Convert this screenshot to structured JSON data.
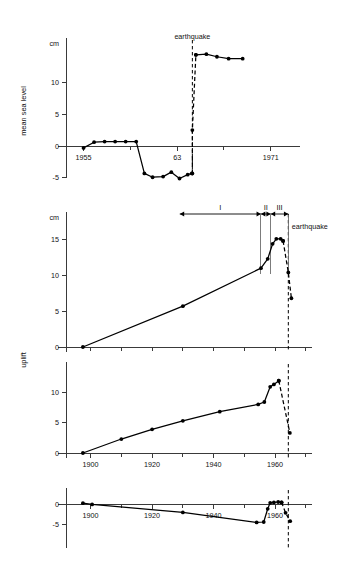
{
  "figure": {
    "title": "",
    "event_label": "earthquake",
    "unit_label": "cm"
  },
  "chart_data": [
    {
      "id": "panel-sea-level",
      "type": "line",
      "title": "",
      "xlabel": "",
      "ylabel": "mean sea level",
      "yunit": "cm",
      "xlim": [
        1953.5,
        1973.5
      ],
      "ylim": [
        -7,
        16
      ],
      "ytick_values": [
        -5,
        0,
        5,
        10
      ],
      "ytick_labels": [
        "-5",
        "0",
        "5",
        "10"
      ],
      "xtick_values": [
        1955,
        1959,
        1963,
        1967,
        1971
      ],
      "xtick_labeled": [
        1955,
        1963,
        1971
      ],
      "xtick_labels": [
        "1955",
        "63",
        "1971"
      ],
      "grid": false,
      "legend": "none",
      "annotations": [
        {
          "text": "earthquake",
          "x": 1964.3,
          "y": 16.8
        }
      ],
      "event_year": 1964.3,
      "series": [
        {
          "name": "pre-earthquake mean sea level",
          "style": "solid",
          "markers": true,
          "points": [
            {
              "x": 1955.0,
              "y": -0.3
            },
            {
              "x": 1955.9,
              "y": 0.6
            },
            {
              "x": 1956.8,
              "y": 0.7
            },
            {
              "x": 1957.7,
              "y": 0.7
            },
            {
              "x": 1958.6,
              "y": 0.7
            },
            {
              "x": 1959.5,
              "y": 0.7
            },
            {
              "x": 1960.2,
              "y": -4.3
            },
            {
              "x": 1960.9,
              "y": -4.9
            },
            {
              "x": 1961.8,
              "y": -4.8
            },
            {
              "x": 1962.5,
              "y": -4.1
            },
            {
              "x": 1963.2,
              "y": -5.1
            },
            {
              "x": 1963.9,
              "y": -4.5
            },
            {
              "x": 1964.25,
              "y": -4.3
            }
          ]
        },
        {
          "name": "co-seismic jump",
          "style": "dashed",
          "markers": true,
          "points": [
            {
              "x": 1964.3,
              "y": -4.3
            },
            {
              "x": 1964.3,
              "y": 2.5
            },
            {
              "x": 1964.6,
              "y": 14.3
            }
          ]
        },
        {
          "name": "post-earthquake mean sea level",
          "style": "solid",
          "markers": true,
          "points": [
            {
              "x": 1964.6,
              "y": 14.3
            },
            {
              "x": 1965.5,
              "y": 14.4
            },
            {
              "x": 1966.4,
              "y": 14.0
            },
            {
              "x": 1967.4,
              "y": 13.7
            },
            {
              "x": 1968.6,
              "y": 13.7
            }
          ]
        }
      ]
    },
    {
      "id": "panel-uplift-large",
      "type": "line",
      "title": "",
      "xlabel": "",
      "ylabel": "uplift",
      "yunit": "cm",
      "xlim": [
        1892,
        1972
      ],
      "ylim": [
        -1.5,
        18
      ],
      "ytick_values": [
        0,
        5,
        10,
        15
      ],
      "ytick_labels": [
        "0",
        "5",
        "10",
        "15"
      ],
      "xtick_values": [
        1900,
        1910,
        1920,
        1930,
        1940,
        1950,
        1960,
        1970
      ],
      "xtick_labeled": [],
      "xtick_labels": [],
      "grid": false,
      "legend": "none",
      "event_year": 1964.3,
      "annotations": [
        {
          "text": "earthquake",
          "x": 1964.8,
          "y": 16.4
        }
      ],
      "phases": [
        {
          "label": "I",
          "x_start": 1929.0,
          "x_end": 1955.4
        },
        {
          "label": "II",
          "x_start": 1955.4,
          "x_end": 1958.6
        },
        {
          "label": "III",
          "x_start": 1958.6,
          "x_end": 1964.3
        }
      ],
      "series": [
        {
          "name": "interseismic uplift",
          "style": "solid",
          "markers": true,
          "points": [
            {
              "x": 1897.5,
              "y": 0.0
            },
            {
              "x": 1930.0,
              "y": 5.7
            },
            {
              "x": 1955.4,
              "y": 11.0
            },
            {
              "x": 1957.6,
              "y": 12.3
            },
            {
              "x": 1959.2,
              "y": 14.4
            },
            {
              "x": 1960.4,
              "y": 15.1
            },
            {
              "x": 1961.8,
              "y": 15.1
            },
            {
              "x": 1962.6,
              "y": 14.8
            }
          ]
        },
        {
          "name": "co-seismic subsidence",
          "style": "dashed",
          "markers": true,
          "points": [
            {
              "x": 1962.6,
              "y": 14.8
            },
            {
              "x": 1964.3,
              "y": 10.4
            },
            {
              "x": 1965.3,
              "y": 6.8
            }
          ]
        }
      ]
    },
    {
      "id": "panel-uplift-small",
      "type": "line",
      "title": "",
      "xlabel": "",
      "ylabel": "",
      "yunit": "",
      "xlim": [
        1892,
        1972
      ],
      "ylim": [
        -1.5,
        14
      ],
      "ytick_values": [
        0,
        5,
        10
      ],
      "ytick_labels": [
        "0",
        "5",
        "10"
      ],
      "xtick_values": [
        1900,
        1910,
        1920,
        1930,
        1940,
        1950,
        1960,
        1970
      ],
      "xtick_labeled": [
        1900,
        1920,
        1940,
        1960
      ],
      "xtick_labels": [
        "1900",
        "1920",
        "1940",
        "1960"
      ],
      "grid": false,
      "legend": "none",
      "event_year": 1964.3,
      "series": [
        {
          "name": "interseismic uplift",
          "style": "solid",
          "markers": true,
          "points": [
            {
              "x": 1897.5,
              "y": 0.0
            },
            {
              "x": 1910.0,
              "y": 2.3
            },
            {
              "x": 1920.0,
              "y": 3.9
            },
            {
              "x": 1930.0,
              "y": 5.3
            },
            {
              "x": 1942.0,
              "y": 6.8
            },
            {
              "x": 1954.5,
              "y": 8.0
            },
            {
              "x": 1956.5,
              "y": 8.4
            },
            {
              "x": 1958.4,
              "y": 10.9
            },
            {
              "x": 1959.6,
              "y": 11.3
            },
            {
              "x": 1961.2,
              "y": 11.9
            }
          ]
        },
        {
          "name": "co-seismic subsidence",
          "style": "dashed",
          "markers": true,
          "points": [
            {
              "x": 1961.2,
              "y": 11.9
            },
            {
              "x": 1964.8,
              "y": 3.3
            }
          ]
        }
      ]
    },
    {
      "id": "panel-subsidence",
      "type": "line",
      "title": "",
      "xlabel": "",
      "ylabel": "",
      "yunit": "",
      "xlim": [
        1892,
        1972
      ],
      "ylim": [
        -7,
        2.5
      ],
      "ytick_values": [
        -5,
        0
      ],
      "ytick_labels": [
        "-5",
        "0"
      ],
      "xtick_values": [
        1900,
        1910,
        1920,
        1930,
        1940,
        1950,
        1960,
        1970
      ],
      "xtick_labeled": [
        1900,
        1920,
        1940,
        1960
      ],
      "xtick_labels": [
        "1900",
        "1920",
        "1940",
        "1960"
      ],
      "grid": false,
      "legend": "none",
      "event_year": 1964.3,
      "series": [
        {
          "name": "interseismic subsidence",
          "style": "solid",
          "markers": true,
          "points": [
            {
              "x": 1897.5,
              "y": 0.2
            },
            {
              "x": 1900.5,
              "y": -0.1
            },
            {
              "x": 1930.0,
              "y": -2.1
            },
            {
              "x": 1954.0,
              "y": -4.6
            },
            {
              "x": 1956.3,
              "y": -4.5
            },
            {
              "x": 1957.6,
              "y": -1.2
            },
            {
              "x": 1958.4,
              "y": 0.3
            },
            {
              "x": 1959.6,
              "y": 0.4
            },
            {
              "x": 1961.0,
              "y": 0.5
            },
            {
              "x": 1962.1,
              "y": 0.4
            }
          ]
        },
        {
          "name": "co-seismic drop",
          "style": "dashed",
          "markers": true,
          "points": [
            {
              "x": 1962.1,
              "y": 0.4
            },
            {
              "x": 1963.4,
              "y": -2.2
            },
            {
              "x": 1964.9,
              "y": -4.3
            }
          ]
        }
      ]
    }
  ],
  "panel_layout": [
    {
      "id": "panel-sea-level",
      "x0": 66,
      "y0": 44,
      "x1": 300,
      "y1": 178,
      "zero_y": 146
    },
    {
      "id": "panel-uplift-large",
      "x0": 66,
      "y0": 218,
      "x1": 312,
      "y1": 352,
      "zero_y": 347
    },
    {
      "id": "panel-uplift-small",
      "x0": 66,
      "y0": 368,
      "x1": 312,
      "y1": 458,
      "zero_y": 453
    },
    {
      "id": "panel-subsidence",
      "x0": 66,
      "y0": 494,
      "x1": 312,
      "y1": 548,
      "zero_y": 504
    }
  ],
  "axis_titles": {
    "sea_level": "mean sea level",
    "uplift": "uplift"
  }
}
